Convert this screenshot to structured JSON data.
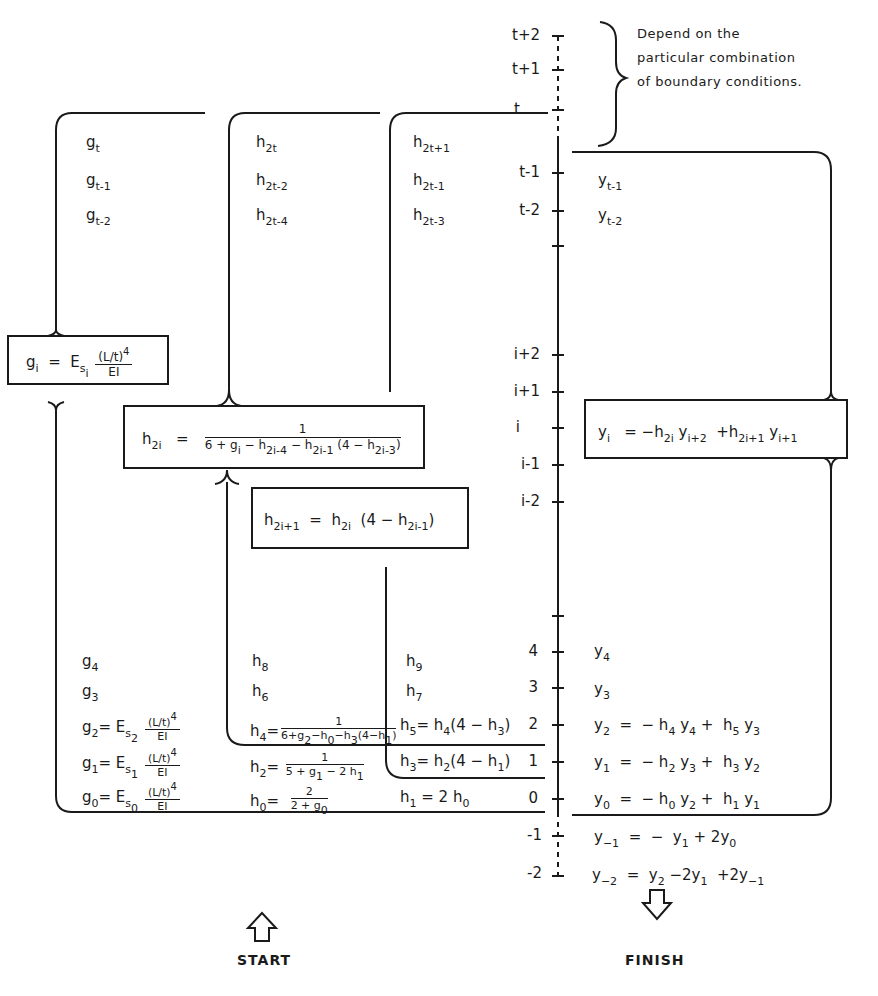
{
  "note": {
    "line1": "Depend on the",
    "line2": "particular combination",
    "line3": "of boundary conditions."
  },
  "axis": {
    "ticks": [
      "t+2",
      "t+1",
      "t",
      "t-1",
      "t-2",
      "i+2",
      "i+1",
      "i",
      "i-1",
      "i-2",
      "4",
      "3",
      "2",
      "1",
      "0",
      "-1",
      "-2"
    ]
  },
  "columns": {
    "g_top": [
      "g_t",
      "g_t-1",
      "g_t-2"
    ],
    "h_even_top": [
      "h_2t",
      "h_2t-2",
      "h_2t-4"
    ],
    "h_odd_top": [
      "h_2t+1",
      "h_2t-1",
      "h_2t-3"
    ],
    "y_top": [
      "y_t-1",
      "y_t-2"
    ],
    "g_bottom": [
      "g_4",
      "g_3"
    ],
    "h_even_bottom": [
      "h_8",
      "h_6"
    ],
    "h_odd_bottom": [
      "h_9",
      "h_7"
    ],
    "y_bottom": [
      "y_4",
      "y_3"
    ]
  },
  "formulas": {
    "g_i": "g_i = E_s_i (L/t)^4 / EI",
    "h_2i": "h_2i = 1 / (6 + g_i - h_2i-4 - h_2i-1 (4 - h_2i-3))",
    "h_2i_plus_1": "h_2i+1 = h_2i (4 - h_2i-1)",
    "y_i": "y_i = -h_2i y_i+2 + h_2i+1 y_i+1",
    "g_2": "g_2 = E_s_2 (L/t)^4 / EI",
    "g_1": "g_1 = E_s_1 (L/t)^4 / EI",
    "g_0": "g_0 = E_s_0 (L/t)^4 / EI",
    "h_4": "h_4 = 1 / (6 + g_2 - h_0 - h_3 (4 - h_1))",
    "h_2": "h_2 = 1 / (5 + g_1 - 2 h_1)",
    "h_0": "h_0 = 2 / (2 + g_0)",
    "h_5": "h_5 = h_4 (4 - h_3)",
    "h_3": "h_3 = h_2 (4 - h_1)",
    "h_1": "h_1 = 2 h_0",
    "y_2": "y_2 = - h_4 y_4 + h_5 y_3",
    "y_1": "y_1 = - h_2 y_3 + h_3 y_2",
    "y_0": "y_0 = - h_0 y_2 + h_1 y_1",
    "y_-1": "y_-1 = - y_1 + 2y_0",
    "y_-2": "y_-2 = y_2 - 2y_1 + 2y_-1"
  },
  "labels": {
    "start": "START",
    "finish": "FINISH"
  },
  "text": {
    "eq": "=",
    "minus": "−",
    "plus": "+",
    "one": "1",
    "two": "2",
    "E": "E",
    "s": "s",
    "g": "g",
    "h": "h",
    "y": "y",
    "Lt4": "(L/t)",
    "pow4": "4",
    "EI": "EI"
  }
}
